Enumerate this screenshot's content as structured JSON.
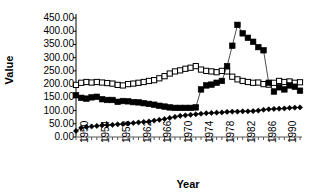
{
  "chart_data": {
    "type": "line",
    "title": "",
    "xlabel": "Year",
    "ylabel": "Value",
    "xlim": [
      1950,
      1993
    ],
    "ylim": [
      0,
      450
    ],
    "ytick_step": 50,
    "grid": false,
    "legend": "none",
    "x": [
      1950,
      1951,
      1952,
      1953,
      1954,
      1955,
      1956,
      1957,
      1958,
      1959,
      1960,
      1961,
      1962,
      1963,
      1964,
      1965,
      1966,
      1967,
      1968,
      1969,
      1970,
      1971,
      1972,
      1973,
      1974,
      1975,
      1976,
      1977,
      1978,
      1979,
      1980,
      1981,
      1982,
      1983,
      1984,
      1985,
      1986,
      1987,
      1988,
      1989,
      1990,
      1991,
      1992,
      1993
    ],
    "xtick_labels": [
      "1950",
      "1954",
      "1958",
      "1962",
      "1966",
      "1970",
      "1974",
      "1978",
      "1982",
      "1986",
      "1990"
    ],
    "ytick_labels": [
      "0.00",
      "50.00",
      "100.00",
      "150.00",
      "200.00",
      "250.00",
      "300.00",
      "350.00",
      "400.00",
      "450.00"
    ],
    "series": [
      {
        "name": "open-square-series",
        "marker": "open-square",
        "color": "#000000",
        "fill": "#ffffff",
        "values": [
          197,
          205,
          208,
          206,
          208,
          206,
          204,
          202,
          197,
          195,
          200,
          202,
          205,
          208,
          212,
          215,
          222,
          230,
          240,
          248,
          252,
          258,
          262,
          268,
          255,
          250,
          248,
          245,
          250,
          248,
          228,
          218,
          212,
          208,
          205,
          206,
          200,
          198,
          205,
          212,
          208,
          210,
          205,
          207
        ]
      },
      {
        "name": "filled-square-series",
        "marker": "filled-square",
        "color": "#000000",
        "fill": "#000000",
        "values": [
          158,
          148,
          145,
          150,
          152,
          143,
          140,
          140,
          133,
          136,
          135,
          132,
          131,
          128,
          125,
          122,
          118,
          115,
          112,
          110,
          110,
          110,
          110,
          112,
          180,
          195,
          198,
          205,
          212,
          268,
          345,
          424,
          392,
          375,
          360,
          340,
          328,
          205,
          172,
          188,
          180,
          195,
          190,
          175
        ]
      },
      {
        "name": "filled-diamond-series",
        "marker": "filled-diamond",
        "color": "#000000",
        "fill": "#000000",
        "values": [
          23,
          35,
          38,
          40,
          42,
          44,
          45,
          46,
          48,
          49,
          51,
          53,
          55,
          57,
          59,
          62,
          65,
          68,
          72,
          76,
          80,
          82,
          84,
          86,
          88,
          90,
          91,
          92,
          93,
          95,
          96,
          96,
          97,
          97,
          98,
          100,
          103,
          105,
          106,
          107,
          108,
          110,
          111,
          112
        ]
      }
    ]
  }
}
